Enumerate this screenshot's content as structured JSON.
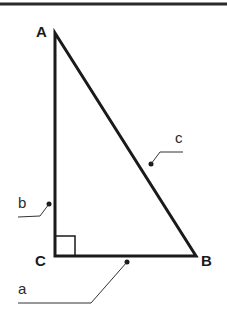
{
  "diagram": {
    "vertices": [
      {
        "label": "A",
        "x": 55,
        "y": 33
      },
      {
        "label": "B",
        "x": 196,
        "y": 256
      },
      {
        "label": "C",
        "x": 55,
        "y": 256
      }
    ],
    "sides": [
      {
        "label": "a",
        "between": "C-B"
      },
      {
        "label": "b",
        "between": "A-C"
      },
      {
        "label": "c",
        "between": "A-B"
      }
    ],
    "right_angle_at": "C",
    "colors": {
      "stroke": "#1a1a1a",
      "leader": "#333333",
      "background": "#ffffff"
    }
  }
}
